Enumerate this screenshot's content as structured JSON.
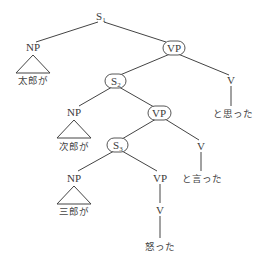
{
  "diagram": {
    "type": "syntax-tree",
    "nodes": {
      "s1": {
        "label": "S",
        "sub": "1"
      },
      "np1": {
        "label": "NP",
        "text": "太郎が"
      },
      "vp1": {
        "label": "VP",
        "circled": true
      },
      "s2": {
        "label": "S",
        "sub": "2",
        "circled": true
      },
      "v1": {
        "label": "V",
        "text": "と思った"
      },
      "np2": {
        "label": "NP",
        "text": "次郎が"
      },
      "vp2": {
        "label": "VP",
        "circled": true
      },
      "s3": {
        "label": "S",
        "sub": "3",
        "circled": true
      },
      "v2": {
        "label": "V",
        "text": "と言った"
      },
      "np3": {
        "label": "NP",
        "text": "三郎が"
      },
      "vp3": {
        "label": "VP"
      },
      "v3": {
        "label": "V",
        "text": "怒った"
      }
    },
    "edges": [
      [
        "s1",
        "np1"
      ],
      [
        "s1",
        "vp1"
      ],
      [
        "vp1",
        "s2"
      ],
      [
        "vp1",
        "v1"
      ],
      [
        "s2",
        "np2"
      ],
      [
        "s2",
        "vp2"
      ],
      [
        "vp2",
        "s3"
      ],
      [
        "vp2",
        "v2"
      ],
      [
        "s3",
        "np3"
      ],
      [
        "s3",
        "vp3"
      ],
      [
        "vp3",
        "v3"
      ]
    ]
  }
}
